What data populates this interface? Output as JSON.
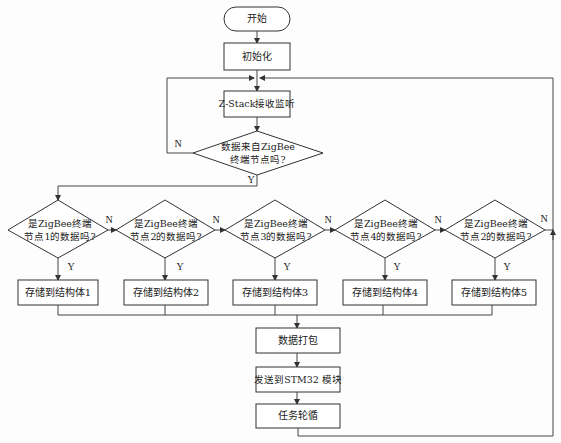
{
  "diagram": {
    "start": "开始",
    "init": "初始化",
    "listen": "Z-Stack接收监听",
    "main_decision": {
      "line1": "数据来自ZigBee",
      "line2": "终端节点吗?"
    },
    "labels": {
      "yes": "Y",
      "no": "N"
    },
    "node_decisions": [
      {
        "line1": "是ZigBee终端",
        "line2": "节点1的数据吗?"
      },
      {
        "line1": "是ZigBee终端",
        "line2": "节点2的数据吗?"
      },
      {
        "line1": "是ZigBee终端",
        "line2": "节点3的数据吗?"
      },
      {
        "line1": "是ZigBee终端",
        "line2": "节点4的数据吗?"
      },
      {
        "line1": "是ZigBee终端",
        "line2": "节点2的数据吗?"
      }
    ],
    "store_boxes": [
      "存储到结构体1",
      "存储到结构体2",
      "存储到结构体3",
      "存储到结构体4",
      "存储到结构体5"
    ],
    "pack": "数据打包",
    "send": "发送到STM32 模块",
    "loop": "任务轮循"
  }
}
